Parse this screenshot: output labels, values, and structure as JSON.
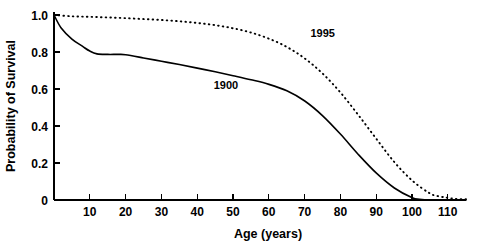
{
  "chart_data": {
    "type": "line",
    "title": "",
    "xlabel": "Age (years)",
    "ylabel": "Probability of Survival",
    "xlim": [
      0,
      115
    ],
    "ylim": [
      0,
      1.05
    ],
    "grid": false,
    "legend_position": "inline-annotation",
    "xticks": [
      10,
      20,
      30,
      40,
      50,
      60,
      70,
      80,
      90,
      100,
      110
    ],
    "xtick_labels": [
      "10",
      "20",
      "30",
      "40",
      "50",
      "60",
      "70",
      "80",
      "90",
      "100",
      "110"
    ],
    "yticks": [
      0,
      0.2,
      0.4,
      0.6,
      0.8,
      1.0
    ],
    "ytick_labels": [
      "0",
      "0.2",
      "0.4",
      "0.6",
      "0.8",
      "1.0"
    ],
    "annotations": [
      {
        "text": "1900",
        "x": 48,
        "y": 0.6,
        "series": "1900"
      },
      {
        "text": "1995",
        "x": 75,
        "y": 0.88,
        "series": "1995"
      }
    ],
    "series": [
      {
        "name": "1900",
        "style": "solid",
        "color": "#000000",
        "x": [
          0,
          2,
          5,
          8,
          10,
          12,
          15,
          18,
          20,
          25,
          30,
          35,
          40,
          45,
          50,
          55,
          60,
          65,
          70,
          75,
          80,
          85,
          90,
          95,
          100,
          102,
          105,
          110,
          115
        ],
        "values": [
          1.0,
          0.93,
          0.87,
          0.83,
          0.805,
          0.79,
          0.787,
          0.787,
          0.785,
          0.768,
          0.75,
          0.732,
          0.713,
          0.693,
          0.672,
          0.65,
          0.625,
          0.59,
          0.535,
          0.455,
          0.355,
          0.245,
          0.145,
          0.065,
          0.012,
          0.004,
          0.0,
          0.0,
          0.0
        ]
      },
      {
        "name": "1995",
        "style": "dotted",
        "color": "#000000",
        "x": [
          0,
          5,
          10,
          15,
          20,
          25,
          30,
          35,
          40,
          45,
          50,
          55,
          60,
          65,
          70,
          75,
          80,
          85,
          90,
          95,
          100,
          105,
          108,
          110,
          112,
          115
        ],
        "values": [
          1.0,
          0.993,
          0.99,
          0.987,
          0.983,
          0.978,
          0.973,
          0.966,
          0.957,
          0.945,
          0.928,
          0.905,
          0.872,
          0.827,
          0.765,
          0.683,
          0.58,
          0.458,
          0.33,
          0.205,
          0.105,
          0.035,
          0.018,
          0.012,
          0.006,
          0.004
        ]
      }
    ]
  }
}
